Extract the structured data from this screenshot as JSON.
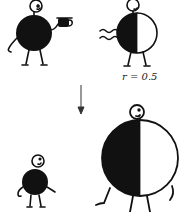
{
  "figure": {
    "panels": [
      {
        "id": "top-left",
        "name": "black-figure-with-cup"
      },
      {
        "id": "top-right",
        "name": "half-black-figure",
        "label": "r = 0.5"
      },
      {
        "id": "bottom-left",
        "name": "small-black-figure"
      },
      {
        "id": "bottom-right",
        "name": "large-half-black-figure"
      }
    ],
    "arrow": {
      "direction": "down"
    },
    "colors": {
      "ink": "#111111",
      "paper": "#ffffff"
    }
  }
}
